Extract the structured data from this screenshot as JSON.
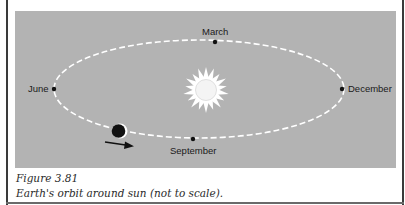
{
  "figure": {
    "number_label": "Figure 3.81",
    "caption": "Earth's orbit around sun (not to scale)."
  },
  "diagram": {
    "orbit": {
      "style": "dashed",
      "color": "#ffffff"
    },
    "sun": {
      "label": "sun",
      "color": "#ffffff"
    },
    "earth": {
      "label": "Earth",
      "dark_color": "#111111",
      "lit_color": "#ffffff",
      "direction": "counterclockwise-arrow"
    },
    "positions": [
      {
        "key": "march",
        "label": "March"
      },
      {
        "key": "june",
        "label": "June"
      },
      {
        "key": "september",
        "label": "September"
      },
      {
        "key": "december",
        "label": "December"
      }
    ]
  },
  "colors": {
    "panel_background": "#b3b3b3",
    "page_background": "#ffffff",
    "rule": "#3a3a3a"
  }
}
